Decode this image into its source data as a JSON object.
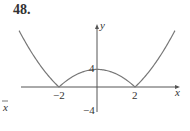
{
  "problem_number": "48.",
  "chart_data": {
    "type": "line",
    "title": "",
    "function": "y = |x^2 - 4|",
    "xlabel": "x",
    "ylabel": "y",
    "x_ticks": [
      "-2",
      "2"
    ],
    "y_ticks": [
      "4",
      "-4"
    ],
    "xlim": [
      -4.3,
      4.3
    ],
    "ylim": [
      -4,
      6
    ],
    "grid": false,
    "legend": null,
    "series": [
      {
        "name": "|x^2 - 4|",
        "x": [
          -4,
          -3.5,
          -3,
          -2.5,
          -2,
          -1.5,
          -1,
          -0.5,
          0,
          0.5,
          1,
          1.5,
          2,
          2.5,
          3,
          3.5,
          4
        ],
        "values": [
          12,
          8.25,
          5,
          2.25,
          0,
          1.75,
          3,
          3.75,
          4,
          3.75,
          3,
          1.75,
          0,
          2.25,
          5,
          8.25,
          12
        ]
      }
    ],
    "annotations": [
      {
        "text": "x",
        "position": "left margin arrow"
      }
    ]
  },
  "labels": {
    "x_axis": "x",
    "y_axis": "y",
    "tick_neg2": "−2",
    "tick_2": "2",
    "tick_4": "4",
    "tick_neg4": "−4",
    "stray_x": "x"
  }
}
